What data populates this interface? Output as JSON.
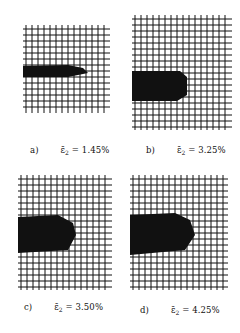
{
  "figure": {
    "panels": [
      {
        "id": "a",
        "label": "a)",
        "symbol": "ε̄",
        "subscript": "2",
        "eq_text": "= 1.45%",
        "strain_percent": 1.45
      },
      {
        "id": "b",
        "label": "b)",
        "symbol": "ε̄",
        "subscript": "2",
        "eq_text": "= 3.25%",
        "strain_percent": 3.25
      },
      {
        "id": "c",
        "label": "c)",
        "symbol": "ε̄",
        "subscript": "2",
        "eq_text": "= 3.50%",
        "strain_percent": 3.5
      },
      {
        "id": "d",
        "label": "d)",
        "symbol": "ε̄",
        "subscript": "2",
        "eq_text": "= 4.25%",
        "strain_percent": 4.25
      }
    ],
    "colors": {
      "ink": "#111111",
      "background": "#ffffff"
    }
  }
}
